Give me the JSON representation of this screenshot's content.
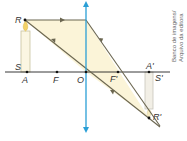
{
  "diagram": {
    "type": "converging-lens-ray-diagram",
    "labels": {
      "object_top": "R",
      "object_base_side": "S",
      "object_base": "A",
      "focus_object": "F",
      "optical_center": "O",
      "focus_image": "F'",
      "image_base": "A'",
      "image_base_side": "S'",
      "image_top": "R'"
    },
    "credit": {
      "line1": "Banco de imagens/",
      "line2": "Arquivo da editora"
    },
    "colors": {
      "lens": "#2a9fd6",
      "axis": "#222222",
      "ray": "#6b6650",
      "beam_fill": "#fbf4d8",
      "candle_body": "#fbf6e2",
      "candle_outline": "#c9c2a0",
      "flame": "#f3d36a",
      "image_body": "#f2efe6",
      "image_outline": "#c9c6bb"
    }
  }
}
